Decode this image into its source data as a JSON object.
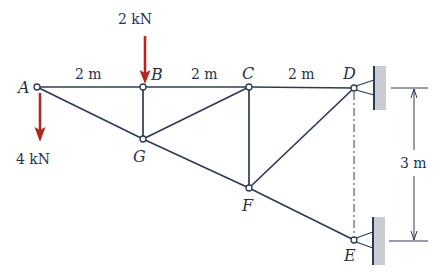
{
  "diagram": {
    "type": "plane truss with loads and supports",
    "colors": {
      "member": "#2e3a55",
      "force": "#b0281e",
      "wall": "#c9ccd2",
      "text": "#2a3345"
    },
    "joints": [
      {
        "id": "A",
        "label": "A",
        "x": 37,
        "y": 87
      },
      {
        "id": "B",
        "label": "B",
        "x": 143,
        "y": 87
      },
      {
        "id": "C",
        "label": "C",
        "x": 249,
        "y": 87
      },
      {
        "id": "D",
        "label": "D",
        "x": 354,
        "y": 88
      },
      {
        "id": "E",
        "label": "E",
        "x": 354,
        "y": 240
      },
      {
        "id": "F",
        "label": "F",
        "x": 249,
        "y": 188
      },
      {
        "id": "G",
        "label": "G",
        "x": 143,
        "y": 139
      }
    ],
    "members": [
      [
        "A",
        "B"
      ],
      [
        "B",
        "C"
      ],
      [
        "C",
        "D"
      ],
      [
        "A",
        "G"
      ],
      [
        "G",
        "F"
      ],
      [
        "F",
        "E"
      ],
      [
        "B",
        "G"
      ],
      [
        "G",
        "C"
      ],
      [
        "C",
        "F"
      ],
      [
        "F",
        "D"
      ]
    ],
    "span_labels": [
      {
        "text": "2 m",
        "between": [
          "A",
          "B"
        ]
      },
      {
        "text": "2 m",
        "between": [
          "B",
          "C"
        ]
      },
      {
        "text": "2 m",
        "between": [
          "C",
          "D"
        ]
      }
    ],
    "height_dimension": {
      "text": "3 m",
      "between": [
        "D",
        "E"
      ]
    },
    "loads": [
      {
        "label": "2 kN",
        "at": "B",
        "direction": "down"
      },
      {
        "label": "4 kN",
        "at": "A",
        "direction": "down"
      }
    ],
    "supports": [
      {
        "at": "D",
        "type": "pin to wall"
      },
      {
        "at": "E",
        "type": "pin to wall"
      }
    ]
  }
}
